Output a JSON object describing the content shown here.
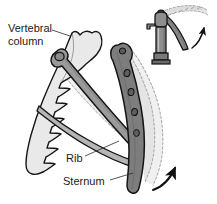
{
  "figure": {
    "width": 217,
    "height": 204,
    "background": "#ffffff"
  },
  "labels": {
    "vertebral_column_line1": "Vertebral",
    "vertebral_column_line2": "column",
    "rib": "Rib",
    "sternum": "Sternum"
  },
  "colors": {
    "outline": "#151515",
    "vertebral_column_fill": "#e9e9e9",
    "rib_fill": "#9a9a9a",
    "rib_fill_light": "#b5b5b5",
    "sternum_fill": "#7d7d7d",
    "sternum_dark": "#5f5f5f",
    "dashed_ghost_fill": "#dcdcdc",
    "dashed_ghost_stroke": "#8d8d8d",
    "pump_body_fill": "#8e8e8e",
    "pump_body_dark": "#6a6a6a",
    "pump_handle_fill": "#888888",
    "arrow_color": "#111111",
    "label_color": "#1a1a1a"
  },
  "parts": {
    "vertebral_column": "vertebral-column",
    "rib": "rib",
    "sternum": "sternum",
    "rib_elevated_ghost": "rib-elevated-position",
    "sternum_elevated_ghost": "sternum-elevated-position",
    "motion_arrow": "motion-arrow",
    "pump_inset": "water-pump-analogy",
    "pump_handle_raised": "pump-handle-raised-position",
    "pump_motion_arrow": "pump-motion-arrow"
  },
  "annotations": {
    "motion_arrow_meaning": "direction of sternum elevation",
    "pump_arrow_meaning": "direction of pump handle movement"
  }
}
